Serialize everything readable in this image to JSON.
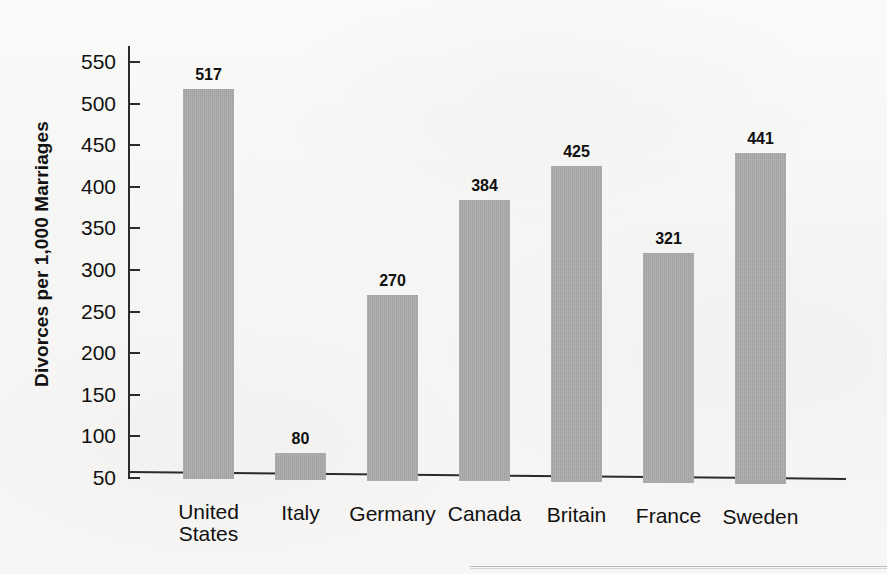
{
  "chart_data": {
    "type": "bar",
    "title": "",
    "xlabel": "",
    "ylabel": "Divorces per 1,000 Marriages",
    "categories": [
      "United\nStates",
      "Italy",
      "Germany",
      "Canada",
      "Britain",
      "France",
      "Sweden"
    ],
    "values": [
      517,
      80,
      270,
      384,
      425,
      321,
      441
    ],
    "value_labels": [
      "517",
      "80",
      "270",
      "384",
      "425",
      "321",
      "441"
    ],
    "ylim": [
      50,
      550
    ],
    "yticks": [
      550,
      500,
      450,
      400,
      350,
      300,
      250,
      200,
      150,
      100,
      50
    ],
    "ytick_labels": [
      "550",
      "500",
      "450",
      "400",
      "350",
      "300",
      "250",
      "200",
      "150",
      "100",
      "50"
    ],
    "grid": false,
    "legend": null,
    "bar_color": "#a9a9a7",
    "axis_color": "#2b2b2b",
    "background_color": "#f7f7f5",
    "baseline_value": 50
  }
}
